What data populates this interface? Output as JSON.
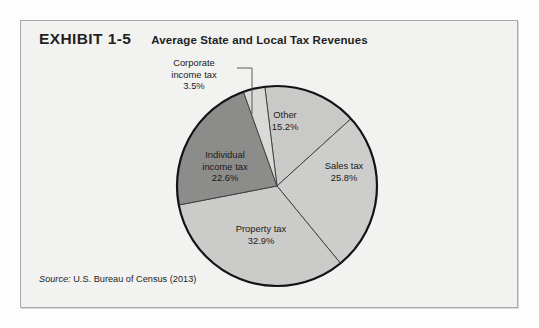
{
  "exhibit": {
    "number": "EXHIBIT 1-5",
    "title": "Average State and Local Tax Revenues",
    "source_prefix": "Source:",
    "source_text": " U.S. Bureau of Census (2013)"
  },
  "chart_data": {
    "type": "pie",
    "title": "Average State and Local Tax Revenues",
    "categories": [
      "Other",
      "Sales tax",
      "Property tax",
      "Individual income tax",
      "Corporate income tax"
    ],
    "values": [
      15.2,
      25.8,
      32.9,
      22.6,
      3.5
    ],
    "value_suffix": "%",
    "labels": [
      {
        "name": "Other",
        "value": "15.2%"
      },
      {
        "name": "Sales tax",
        "value": "25.8%"
      },
      {
        "name": "Property tax",
        "value": "32.9%"
      },
      {
        "name": "Individual income tax",
        "value": "22.6%"
      },
      {
        "name": "Corporate income tax",
        "value": "3.5%"
      }
    ],
    "label_lines": {
      "corporate_line1": "Corporate",
      "corporate_line2": "income tax",
      "corporate_value": "3.5%",
      "other_name": "Other",
      "other_value": "15.2%",
      "sales_name": "Sales tax",
      "sales_value": "25.8%",
      "individual_line1": "Individual",
      "individual_line2": "income tax",
      "individual_value": "22.6%",
      "property_name": "Property tax",
      "property_value": "32.9%"
    },
    "colors": {
      "other": "#c9c9c7",
      "sales_tax": "#cdcdcb",
      "property_tax": "#cbcbc9",
      "individual_income_tax": "#8c8c8a",
      "corporate_income_tax": "#d9d9d7",
      "outline": "#1a1a1a",
      "background": "#f2f2f1",
      "frame_border": "#a9a9a9",
      "text": "#231f20"
    },
    "legend": "none",
    "grid": false,
    "start_angle_deg": -97
  }
}
